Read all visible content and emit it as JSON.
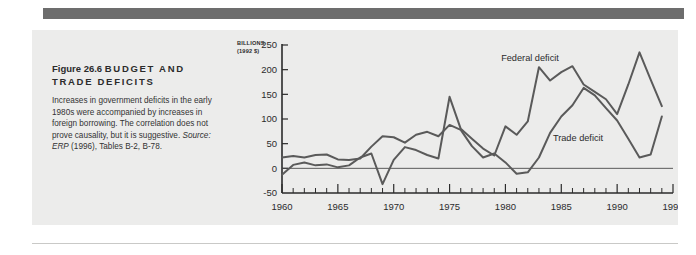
{
  "figure": {
    "number_label": "Figure 26.6",
    "title": "BUDGET AND TRADE DEFICITS",
    "title_line1": "BUDGET AND",
    "title_line2": "TRADE DEFICITS",
    "caption_part1": "Increases in government deficits in the early 1980s were accompanied by increases in foreign borrowing. The correlation does not prove causality, but it is suggestive. ",
    "caption_source_prefix": "Source: ",
    "caption_source_pub": "ERP",
    "caption_part2": " (1996), Tables B-2, B-78."
  },
  "colors": {
    "page_background": "#ffffff",
    "panel_background": "#ececeb",
    "top_bar": "#6d6d6d",
    "line": "#5a5a5a",
    "axis": "#2b2b2b",
    "text": "#2b2b2b"
  },
  "chart_data": {
    "type": "line",
    "title": "BUDGET AND TRADE DEFICITS",
    "xlabel": "",
    "ylabel": "BILLIONS (1992 $)",
    "ylabel_line1": "BILLIONS",
    "ylabel_line2": "(1992 $)",
    "xlim": [
      1960,
      1995
    ],
    "ylim": [
      -50,
      250
    ],
    "yticks": [
      -50,
      0,
      50,
      100,
      150,
      200,
      250
    ],
    "ytick_labels": [
      "-50",
      "0",
      "50",
      "100",
      "150",
      "200",
      "250"
    ],
    "xticks": [
      1960,
      1965,
      1970,
      1975,
      1980,
      1985,
      1990,
      1995
    ],
    "xtick_labels": [
      "1960",
      "1965",
      "1970",
      "1975",
      "1980",
      "1985",
      "1990",
      "1995"
    ],
    "minor_xtick_interval": 1,
    "grid": false,
    "legend": "inline-annotations",
    "zero_reference_line": 0,
    "x": [
      1960,
      1961,
      1962,
      1963,
      1964,
      1965,
      1966,
      1967,
      1968,
      1969,
      1970,
      1971,
      1972,
      1973,
      1974,
      1975,
      1976,
      1977,
      1978,
      1979,
      1980,
      1981,
      1982,
      1983,
      1984,
      1985,
      1986,
      1987,
      1988,
      1989,
      1990,
      1991,
      1992,
      1993,
      1994
    ],
    "series": [
      {
        "name": "Federal deficit",
        "label_position": {
          "x": 1982.2,
          "y": 218
        },
        "values": [
          -13,
          7,
          12,
          6,
          8,
          2,
          6,
          22,
          30,
          -32,
          17,
          43,
          37,
          27,
          20,
          145,
          80,
          60,
          40,
          26,
          85,
          68,
          95,
          205,
          178,
          195,
          207,
          170,
          155,
          140,
          110,
          170,
          235,
          180,
          126
        ]
      },
      {
        "name": "Trade deficit",
        "label_position": {
          "x": 1986.5,
          "y": 55
        },
        "values": [
          22,
          25,
          22,
          27,
          28,
          18,
          17,
          20,
          44,
          65,
          63,
          52,
          68,
          74,
          65,
          88,
          78,
          45,
          22,
          30,
          12,
          -11,
          -8,
          22,
          72,
          105,
          128,
          163,
          148,
          122,
          97,
          60,
          22,
          28,
          105
        ]
      }
    ],
    "annotations": [
      {
        "text": "Federal deficit",
        "x": 1982.2,
        "y": 218
      },
      {
        "text": "Trade deficit",
        "x": 1986.5,
        "y": 55
      }
    ]
  }
}
